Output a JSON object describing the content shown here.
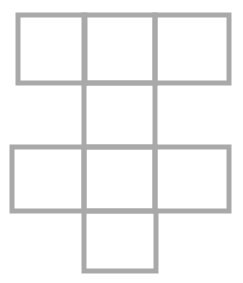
{
  "diagram": {
    "title": "",
    "stroke_color": "#a9a9a9",
    "fill_color": "#ffffff",
    "stroke_width": 5,
    "squares": [
      {
        "id": "top-left",
        "x": 18,
        "y": 15,
        "w": 67,
        "h": 68
      },
      {
        "id": "top-center",
        "x": 84,
        "y": 15,
        "w": 71,
        "h": 68
      },
      {
        "id": "top-right",
        "x": 155,
        "y": 15,
        "w": 74,
        "h": 68
      },
      {
        "id": "middle-center",
        "x": 84,
        "y": 83,
        "w": 71,
        "h": 64
      },
      {
        "id": "row3-left",
        "x": 12,
        "y": 147,
        "w": 72,
        "h": 64
      },
      {
        "id": "row3-center",
        "x": 84,
        "y": 147,
        "w": 71,
        "h": 64
      },
      {
        "id": "row3-right",
        "x": 155,
        "y": 147,
        "w": 74,
        "h": 64
      },
      {
        "id": "bottom-center",
        "x": 84,
        "y": 211,
        "w": 72,
        "h": 60
      }
    ]
  }
}
